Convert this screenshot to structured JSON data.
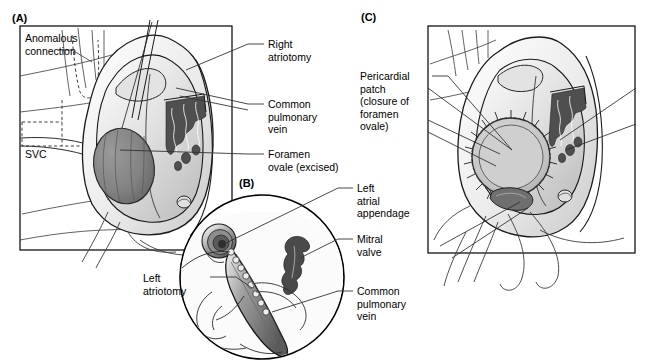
{
  "figure": {
    "background_color": "#ffffff",
    "line_color": "#1a1a1a",
    "panels": [
      {
        "id": "A",
        "letter": "(A)",
        "description": "Right atrial view showing anomalous connection, SVC, right atriotomy, common pulmonary vein and excised foramen ovale"
      },
      {
        "id": "B",
        "letter": "(B)",
        "description": "Circular inset showing left atriotomy, left atrial appendage, mitral valve and common pulmonary vein"
      },
      {
        "id": "C",
        "letter": "(C)",
        "description": "Completed repair with pericardial patch closing the foramen ovale"
      }
    ]
  },
  "labels": {
    "anomalous_connection": "Anomalous\nconnection",
    "svc": "SVC",
    "right_atriotomy": "Right\natriotomy",
    "common_pulmonary_vein_a": "Common\npulmonary\nvein",
    "foramen_ovale_excised": "Foramen\novale (excised)",
    "pericardial_patch": "Pericardial\npatch\n(closure of\nforamen\novale)",
    "left_atrial_appendage": "Left\natrial\nappendage",
    "mitral_valve": "Mitral\nvalve",
    "common_pulmonary_vein_b": "Common\npulmonary\nvein",
    "left_atriotomy": "Left\natriotomy"
  },
  "colors": {
    "outline": "#1a1a1a",
    "leader_line": "#333333",
    "tissue_light": "#f2f2f2",
    "tissue_mid": "#d6d6d6",
    "tissue_shadow": "#b3b3b3",
    "foramen_ovale": "#8a8a8a",
    "foramen_ovale_dark": "#6e6e6e",
    "pectinate_muscle": "#555555",
    "mitral_valve": "#4d4d4d",
    "patch_fill": "#c9c9c9",
    "frame": "#000000",
    "text": "#000000"
  }
}
